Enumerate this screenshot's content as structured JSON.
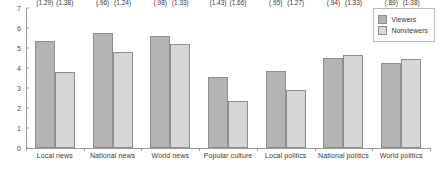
{
  "chart_data": {
    "type": "bar",
    "title": "",
    "xlabel": "",
    "ylabel": "",
    "ylim": [
      0,
      7
    ],
    "ytick_labels": [
      "0",
      "1",
      "2",
      "3",
      "4",
      "5",
      "6",
      "7"
    ],
    "grid": false,
    "legend_position": "top-right",
    "categories": [
      "Local news",
      "National news",
      "World news",
      "Popular culture",
      "Local politics",
      "National politics",
      "World politics"
    ],
    "series": [
      {
        "name": "Viewers",
        "color": "#b3b3b3",
        "values": [
          5.34,
          5.73,
          5.61,
          3.56,
          3.85,
          4.49,
          4.27
        ],
        "value_labels": [
          "5.34*",
          "5.73*",
          "5.61",
          "3.56*",
          "3.85*",
          "4.49",
          "4.27"
        ],
        "sd_labels": [
          "(1.29)",
          "(.96)",
          "(.98)",
          "(1.43)",
          "(.95)",
          "(.94)",
          "(.89)"
        ]
      },
      {
        "name": "Nonviewers",
        "color": "#d6d6d6",
        "values": [
          3.82,
          4.81,
          5.21,
          2.35,
          2.88,
          4.63,
          4.46
        ],
        "value_labels": [
          "3.82",
          "4.81",
          "5.21",
          "2.35",
          "2.88",
          "4.63",
          "4.46"
        ],
        "sd_labels": [
          "(1.38)",
          "(1.24)",
          "(1.33)",
          "(1.66)",
          "(1.27)",
          "(1.33)",
          "(1.38)"
        ]
      }
    ]
  },
  "legend": {
    "items": [
      {
        "label": "Viewers",
        "color": "#b3b3b3"
      },
      {
        "label": "Nonviewers",
        "color": "#d6d6d6"
      }
    ]
  }
}
